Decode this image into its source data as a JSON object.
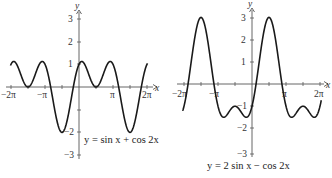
{
  "chart_data": [
    {
      "type": "line",
      "title": "y = sin x + cos 2x",
      "equation_label": "y = sin x + cos 2x",
      "xlabel": "x",
      "ylabel": "y",
      "xlim": [
        "-2π",
        "2π"
      ],
      "ylim": [
        -3,
        3
      ],
      "x_tick_labels": [
        "-2π",
        "-π",
        "π",
        "2π"
      ],
      "y_tick_labels": [
        "3",
        "2",
        "1",
        "-2",
        "-3"
      ],
      "grid": false,
      "series": [
        {
          "name": "sin x + cos 2x",
          "x": [
            "-2π",
            "-3π/2",
            "-5π/6",
            "-π/2",
            "-π/6",
            "0",
            "π/6",
            "π/2",
            "5π/6",
            "3π/2",
            "11π/6",
            "2π"
          ],
          "values": [
            1,
            0,
            1.125,
            -2,
            0,
            1,
            1.125,
            0,
            1.125,
            -2,
            0,
            1
          ]
        }
      ]
    },
    {
      "type": "line",
      "title": "y = 2 sin x − cos 2x",
      "equation_label": "y = 2 sin x − cos 2x",
      "xlabel": "x",
      "ylabel": "y",
      "xlim": [
        "-2π",
        "2π"
      ],
      "ylim": [
        -3,
        3
      ],
      "x_tick_labels": [
        "-2π",
        "-π",
        "π",
        "2π"
      ],
      "y_tick_labels": [
        "3",
        "2",
        "1",
        "-1",
        "-2",
        "-3"
      ],
      "grid": false,
      "series": [
        {
          "name": "2 sin x − cos 2x",
          "x": [
            "-2π",
            "-3π/2",
            "-π",
            "-π/2",
            "0",
            "π/2",
            "π",
            "3π/2",
            "2π"
          ],
          "values": [
            -1,
            3,
            -1,
            -1,
            -1,
            3,
            -1,
            -1,
            -1
          ]
        }
      ]
    }
  ],
  "left": {
    "axis_x_label": "x",
    "axis_y_label": "y",
    "ticks": {
      "x": [
        "−2π",
        "−π",
        "π",
        "2π"
      ],
      "y": [
        "3",
        "2",
        "1",
        "−2",
        "−3"
      ]
    },
    "equation": "y = sin x + cos 2x"
  },
  "right": {
    "axis_x_label": "x",
    "axis_y_label": "y",
    "ticks": {
      "x": [
        "−2π",
        "−π",
        "π",
        "2π"
      ],
      "y": [
        "3",
        "2",
        "1",
        "−1",
        "−2",
        "−3"
      ]
    },
    "equation": "y = 2 sin x − cos 2x"
  },
  "colors": {
    "curve": "#1a1a1a",
    "axis": "#555555",
    "background": "#ffffff"
  }
}
